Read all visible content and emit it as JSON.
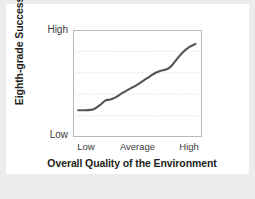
{
  "chart_data": {
    "type": "line",
    "title": "",
    "subtitle": "",
    "xlabel": "Overall Quality of the Environment",
    "ylabel": "Eighth-grade Success",
    "xticklabels": [
      "Low",
      "Average",
      "High"
    ],
    "xtick_positions": [
      0.1,
      0.5,
      0.9
    ],
    "yticklabels": [
      "High",
      "Low"
    ],
    "ylim": [
      0,
      1
    ],
    "xlim": [
      0,
      1
    ],
    "grid": true,
    "grid_orientation": "horizontal",
    "gridline_values": [
      0.8,
      0.6,
      0.4,
      0.2
    ],
    "legend": "none",
    "series": [
      {
        "name": "Eighth-grade success vs environment quality",
        "color": "#555558",
        "x": [
          0.04,
          0.1,
          0.16,
          0.21,
          0.25,
          0.29,
          0.33,
          0.38,
          0.44,
          0.5,
          0.55,
          0.6,
          0.64,
          0.68,
          0.72,
          0.76,
          0.8,
          0.85,
          0.9,
          0.95
        ],
        "y": [
          0.25,
          0.25,
          0.26,
          0.3,
          0.34,
          0.35,
          0.37,
          0.41,
          0.45,
          0.49,
          0.53,
          0.57,
          0.6,
          0.62,
          0.63,
          0.66,
          0.72,
          0.79,
          0.84,
          0.87
        ]
      }
    ],
    "annotations": [],
    "colors": {
      "curve": "#555558",
      "frame": "#b9b9bb",
      "gridline": "#c9c9cb",
      "text": "#231f20",
      "tick_text": "#3b3b3d",
      "card_background": "#ffffff",
      "page_background": "#ececed"
    }
  },
  "axes": {
    "y_title": "Eighth-grade Success",
    "y_high_label": "High",
    "y_low_label": "Low",
    "x_title": "Overall Quality of the Environment",
    "x_low_label": "Low",
    "x_average_label": "Average",
    "x_high_label": "High"
  }
}
